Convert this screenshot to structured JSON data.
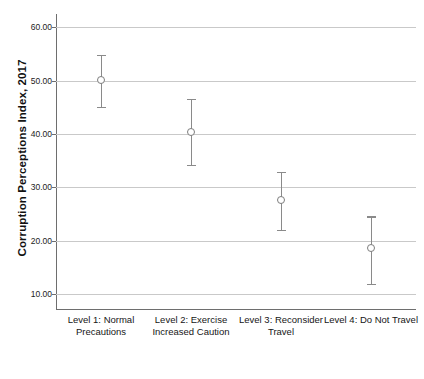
{
  "chart_data": {
    "type": "scatter",
    "title": "",
    "xlabel": "",
    "ylabel": "Corruption Perceptions Index, 2017",
    "ylim": [
      7,
      62.5
    ],
    "grid": true,
    "legend": false,
    "error_bars": true,
    "error_bar_type": "95% confidence interval",
    "categories": [
      "Level 1: Normal Precautions",
      "Level 2: Exercise Increased Caution",
      "Level 3: Reconsider Travel",
      "Level 4: Do Not Travel"
    ],
    "values": [
      50.1,
      40.4,
      27.6,
      18.6
    ],
    "error_low": [
      45.1,
      34.2,
      22.0,
      11.9
    ],
    "error_high": [
      54.9,
      46.6,
      32.9,
      24.6
    ],
    "y_ticks": [
      10,
      20,
      30,
      40,
      50,
      60
    ],
    "y_tick_labels": [
      "10.00",
      "20.00",
      "30.00",
      "40.00",
      "50.00",
      "60.00"
    ]
  },
  "axis": {
    "y_title": "Corruption Perceptions Index, 2017"
  },
  "style": {
    "grid_color": "#c9c9c9",
    "axis_color": "#6e6e6e",
    "marker_color": "#7d7d7d",
    "whisker_color": "#8a8a8a",
    "background": "#ffffff"
  }
}
